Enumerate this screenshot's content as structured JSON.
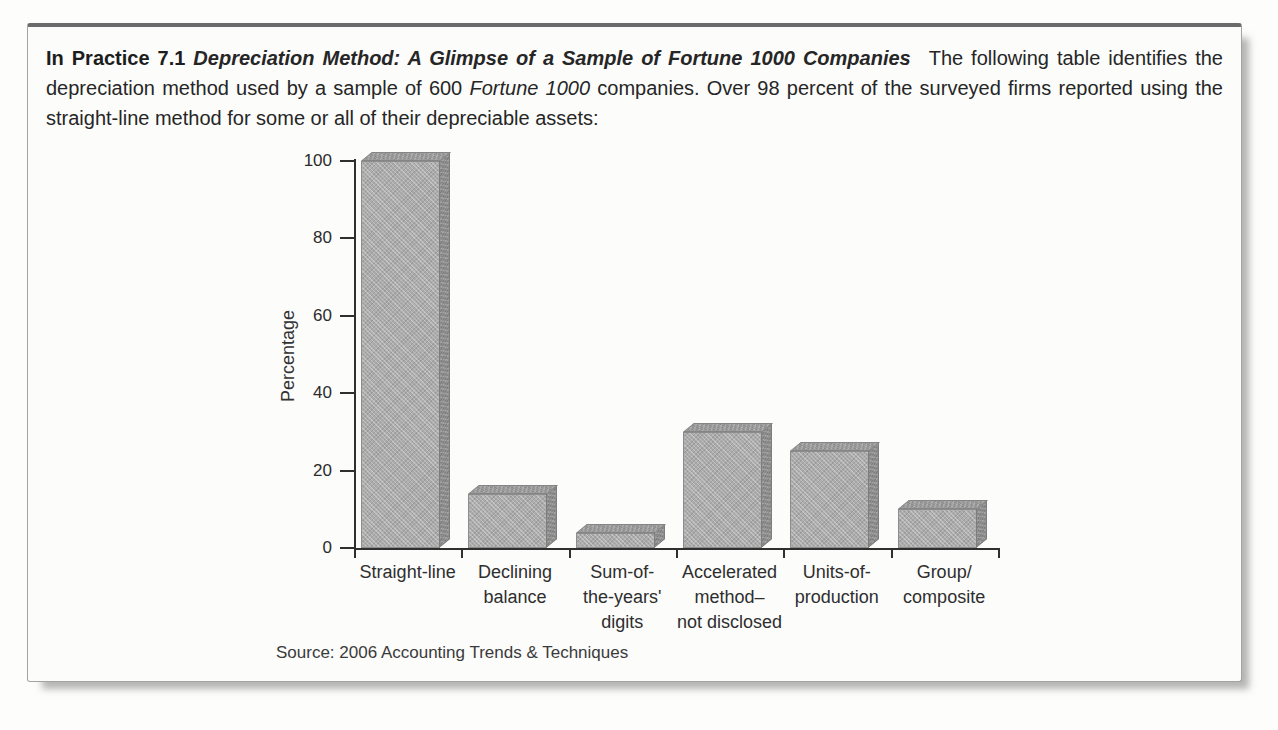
{
  "header": {
    "label": "In Practice 7.1",
    "title": "Depreciation Method: A Glimpse of a Sample of Fortune 1000 Companies",
    "body_1": "The following table identifies the depreciation method used by a sample of 600",
    "body_italic": "Fortune 1000",
    "body_2": "companies. Over 98 percent of the surveyed firms reported using the straight-line method for some or all of their depreciable assets:"
  },
  "chart_data": {
    "type": "bar",
    "categories": [
      "Straight-line",
      "Declining\nbalance",
      "Sum-of-\nthe-years'\ndigits",
      "Accelerated\nmethod–\nnot disclosed",
      "Units-of-\nproduction",
      "Group/\ncomposite"
    ],
    "values": [
      100,
      14,
      4,
      30,
      25,
      10
    ],
    "title": "",
    "xlabel": "",
    "ylabel": "Percentage",
    "yticks": [
      0,
      20,
      40,
      60,
      80,
      100
    ],
    "ylim": [
      0,
      100
    ],
    "grid": false,
    "legend": "none",
    "source": "Source: 2006 Accounting Trends & Techniques",
    "colors": {
      "bar_front": "#acacac",
      "bar_side": "#8e8e8e",
      "bar_top": "#9b9b9b",
      "axis": "#2f2f2f"
    }
  }
}
